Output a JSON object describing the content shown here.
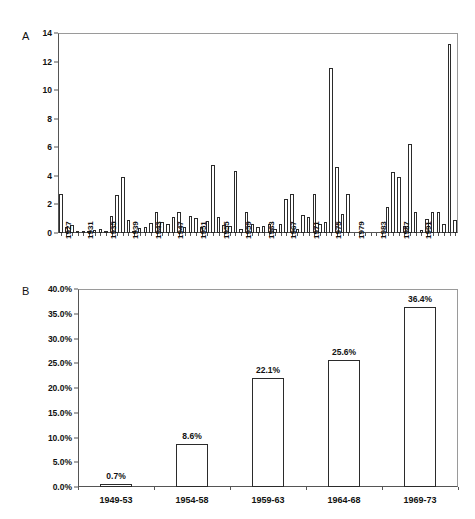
{
  "figure": {
    "panel_a_letter": "A",
    "panel_b_letter": "B"
  },
  "chart_data": [
    {
      "id": "panel_a",
      "type": "bar",
      "title": "",
      "subtitle": "",
      "xlabel": "",
      "ylabel": "",
      "ylim": [
        0,
        14
      ],
      "yticks": [
        0,
        2,
        4,
        6,
        8,
        10,
        12,
        14
      ],
      "ytick_labels": [
        "0",
        "2",
        "4",
        "6",
        "8",
        "10",
        "12",
        "14"
      ],
      "grid": false,
      "legend": null,
      "xtick_labels": [
        "1927",
        "1931",
        "1935",
        "1939",
        "1943",
        "1947",
        "1951",
        "1955",
        "1959",
        "1963",
        "1967",
        "1971",
        "1975",
        "1979",
        "1983",
        "1987",
        "1991"
      ],
      "xtick_step": 4,
      "categories": [
        "1927",
        "1928",
        "1929",
        "1930",
        "1931",
        "1932",
        "1933",
        "1934",
        "1935",
        "1936",
        "1937",
        "1938",
        "1939",
        "1940",
        "1941",
        "1942",
        "1943",
        "1944",
        "1945",
        "1946",
        "1947",
        "1948",
        "1949",
        "1950",
        "1951",
        "1952",
        "1953",
        "1954",
        "1955",
        "1956",
        "1957",
        "1958",
        "1959",
        "1960",
        "1961",
        "1962",
        "1963",
        "1964",
        "1965",
        "1966",
        "1967",
        "1968",
        "1969",
        "1970",
        "1971",
        "1972",
        "1973",
        "1974",
        "1975",
        "1976",
        "1977",
        "1978",
        "1979",
        "1980",
        "1981",
        "1982",
        "1983",
        "1984",
        "1985",
        "1986",
        "1987",
        "1988",
        "1989",
        "1990",
        "1991",
        "1992",
        "1993",
        "1994"
      ],
      "values": [
        2.7,
        0.45,
        0.55,
        0.1,
        0.05,
        0.15,
        0.2,
        0.25,
        0.05,
        1.2,
        2.65,
        3.95,
        0.9,
        0.1,
        0.35,
        0.4,
        0.7,
        1.45,
        0.75,
        0.65,
        1.15,
        1.45,
        0.45,
        1.2,
        1.05,
        0.45,
        0.85,
        4.75,
        1.15,
        0.55,
        0.5,
        4.35,
        0.25,
        1.5,
        0.6,
        0.45,
        0.5,
        0.65,
        0.25,
        0.65,
        2.35,
        2.75,
        0.3,
        1.25,
        1.1,
        2.7,
        0.6,
        0.75,
        11.55,
        4.6,
        1.3,
        2.75,
        0.0,
        0.0,
        0.0,
        0.0,
        0.0,
        0.0,
        1.85,
        4.25,
        3.9,
        0.5,
        6.2,
        1.45,
        0.2,
        1.0,
        1.45,
        1.45,
        0.65,
        13.25,
        0.9
      ]
    },
    {
      "id": "panel_b",
      "type": "bar",
      "title": "",
      "subtitle": "",
      "xlabel": "",
      "ylabel": "",
      "ylim": [
        0,
        40
      ],
      "yticks": [
        0,
        5,
        10,
        15,
        20,
        25,
        30,
        35,
        40
      ],
      "ytick_labels": [
        "0.0%",
        "5.0%",
        "10.0%",
        "15.0%",
        "20.0%",
        "25.0%",
        "30.0%",
        "35.0%",
        "40.0%"
      ],
      "grid": false,
      "legend": null,
      "categories": [
        "1949-53",
        "1954-58",
        "1959-63",
        "1964-68",
        "1969-73"
      ],
      "values": [
        0.7,
        8.6,
        22.1,
        25.6,
        36.4
      ],
      "data_labels": [
        "0.7%",
        "8.6%",
        "22.1%",
        "25.6%",
        "36.4%"
      ]
    }
  ]
}
